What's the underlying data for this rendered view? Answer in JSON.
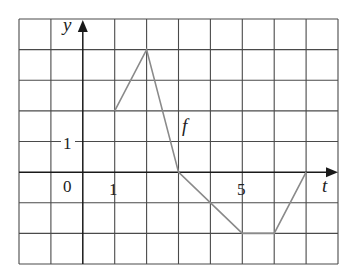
{
  "chart_data": {
    "type": "line",
    "title": "",
    "xlabel": "t",
    "ylabel": "y",
    "series": [
      {
        "name": "f",
        "x": [
          1,
          2,
          3,
          5,
          6,
          7
        ],
        "values": [
          2,
          4,
          0,
          -2,
          -2,
          0
        ]
      }
    ],
    "xlim": [
      -2,
      8
    ],
    "ylim": [
      -3,
      5
    ],
    "x_tick_labels": [
      {
        "value": 1,
        "label": "1"
      },
      {
        "value": 5,
        "label": "5"
      }
    ],
    "y_tick_labels": [
      {
        "value": 1,
        "label": "1"
      }
    ],
    "origin_label": "0",
    "grid": true,
    "grid_step": 1,
    "legend": "none",
    "annotations": [
      {
        "text": "f",
        "x": 3.2,
        "y": 1.6
      }
    ]
  },
  "labels": {
    "x_axis": "t",
    "y_axis": "y",
    "origin": "0",
    "x_tick_1": "1",
    "x_tick_5": "5",
    "y_tick_1": "1",
    "curve": "f"
  },
  "colors": {
    "grid": "#4a4a4a",
    "axis": "#1a1a1a",
    "curve": "#8a8a8a",
    "text": "#222222",
    "background": "#ffffff"
  }
}
